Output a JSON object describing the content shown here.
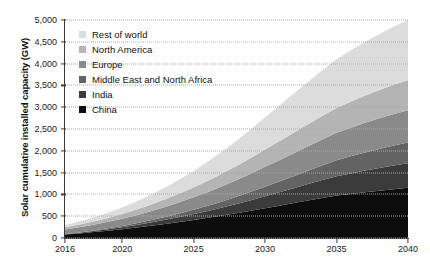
{
  "chart_data": {
    "type": "area",
    "stacked": true,
    "title": "",
    "xlabel": "",
    "ylabel": "Solar cumulative installed capacity (GW)",
    "x": [
      2016,
      2017,
      2018,
      2019,
      2020,
      2021,
      2022,
      2023,
      2024,
      2025,
      2026,
      2027,
      2028,
      2029,
      2030,
      2031,
      2032,
      2033,
      2034,
      2035,
      2036,
      2037,
      2038,
      2039,
      2040
    ],
    "xlim": [
      2016,
      2040
    ],
    "ylim": [
      0,
      5000
    ],
    "ytick_labels": [
      "0",
      "500",
      "1,000",
      "1,500",
      "2,000",
      "2,500",
      "3,000",
      "3,500",
      "4,000",
      "4,500",
      "5,000"
    ],
    "ytick_values": [
      0,
      500,
      1000,
      1500,
      2000,
      2500,
      3000,
      3500,
      4000,
      4500,
      5000
    ],
    "xtick_labels": [
      "2016",
      "2020",
      "2025",
      "2030",
      "2035",
      "2040"
    ],
    "xtick_values": [
      2016,
      2020,
      2025,
      2030,
      2035,
      2040
    ],
    "grid": "horizontal-dotted",
    "legend_position": "top-left",
    "stack_order_bottom_to_top": [
      "China",
      "India",
      "Middle East and North Africa",
      "Europe",
      "North America",
      "Rest of world"
    ],
    "series": [
      {
        "name": "China",
        "color": "#0d0d0d",
        "values": [
          78,
          105,
          135,
          168,
          203,
          240,
          280,
          322,
          366,
          412,
          462,
          514,
          568,
          624,
          682,
          740,
          800,
          860,
          918,
          975,
          1010,
          1048,
          1083,
          1118,
          1150
        ]
      },
      {
        "name": "India",
        "color": "#3b3b3b",
        "values": [
          10,
          16,
          24,
          34,
          46,
          60,
          76,
          94,
          114,
          136,
          160,
          186,
          214,
          244,
          276,
          308,
          342,
          376,
          410,
          444,
          472,
          498,
          522,
          545,
          565
        ]
      },
      {
        "name": "Middle East and North Africa",
        "color": "#636363",
        "values": [
          4,
          8,
          13,
          20,
          28,
          38,
          50,
          64,
          80,
          98,
          118,
          140,
          164,
          190,
          218,
          246,
          276,
          306,
          336,
          366,
          392,
          416,
          438,
          458,
          475
        ]
      },
      {
        "name": "Europe",
        "color": "#8a8a8a",
        "values": [
          105,
          118,
          132,
          148,
          166,
          186,
          208,
          232,
          258,
          286,
          316,
          348,
          382,
          418,
          456,
          492,
          528,
          562,
          596,
          628,
          655,
          680,
          702,
          722,
          740
        ]
      },
      {
        "name": "North America",
        "color": "#b4b4b4",
        "values": [
          48,
          60,
          74,
          90,
          108,
          128,
          150,
          174,
          200,
          228,
          258,
          290,
          324,
          360,
          398,
          434,
          470,
          504,
          538,
          570,
          598,
          624,
          648,
          670,
          690
        ]
      },
      {
        "name": "Rest of world",
        "color": "#dcdcdc",
        "values": [
          55,
          72,
          94,
          120,
          150,
          186,
          226,
          272,
          322,
          378,
          440,
          508,
          580,
          658,
          740,
          820,
          898,
          974,
          1048,
          1118,
          1180,
          1236,
          1288,
          1336,
          1380
        ]
      }
    ],
    "totals_at_ticks": {
      "2016": 300,
      "2020": 701,
      "2025": 1538,
      "2030": 2770,
      "2035": 4101,
      "2040": 5000
    }
  },
  "legend": {
    "items": [
      {
        "label": "Rest of world",
        "color": "#dcdcdc"
      },
      {
        "label": "North America",
        "color": "#b4b4b4"
      },
      {
        "label": "Europe",
        "color": "#8a8a8a"
      },
      {
        "label": "Middle East and North Africa",
        "color": "#636363"
      },
      {
        "label": "India",
        "color": "#3b3b3b"
      },
      {
        "label": "China",
        "color": "#0d0d0d"
      }
    ]
  },
  "axes": {
    "y_title": "Solar cumulative installed capacity (GW)"
  }
}
